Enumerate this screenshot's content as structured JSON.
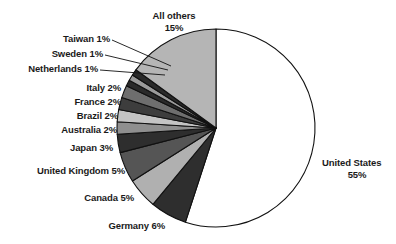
{
  "chart_data": {
    "type": "pie",
    "title": "",
    "subtitle": "",
    "xlabel": "",
    "ylabel": "",
    "legend": "none",
    "grid": false,
    "units": "percent",
    "start_angle_deg": 0,
    "direction": "clockwise",
    "categories": [
      "United States",
      "Germany",
      "Canada",
      "United Kingdom",
      "Japan",
      "Australia",
      "Brazil",
      "France",
      "Italy",
      "Netherlands",
      "Sweden",
      "Taiwan",
      "All others"
    ],
    "values": [
      55,
      6,
      5,
      5,
      3,
      2,
      2,
      2,
      2,
      1,
      1,
      1,
      15
    ],
    "slices": [
      {
        "name": "United States",
        "value": 55,
        "label": "United States",
        "value_label": "55%",
        "color": "#ffffff"
      },
      {
        "name": "Germany",
        "value": 6,
        "label": "Germany",
        "value_label": "6%",
        "color": "#2e2e2e"
      },
      {
        "name": "Canada",
        "value": 5,
        "label": "Canada",
        "value_label": "5%",
        "color": "#b0b0b0"
      },
      {
        "name": "United Kingdom",
        "value": 5,
        "label": "United Kingdom",
        "value_label": "5%",
        "color": "#555555"
      },
      {
        "name": "Japan",
        "value": 3,
        "label": "Japan",
        "value_label": "3%",
        "color": "#2e2e2e"
      },
      {
        "name": "Australia",
        "value": 2,
        "label": "Australia",
        "value_label": "2%",
        "color": "#8f8f8f"
      },
      {
        "name": "Brazil",
        "value": 2,
        "label": "Brazil",
        "value_label": "2%",
        "color": "#c4c4c4"
      },
      {
        "name": "France",
        "value": 2,
        "label": "France",
        "value_label": "2%",
        "color": "#3d3d3d"
      },
      {
        "name": "Italy",
        "value": 2,
        "label": "Italy",
        "value_label": "2%",
        "color": "#6e6e6e"
      },
      {
        "name": "Netherlands",
        "value": 1,
        "label": "Netherlands",
        "value_label": "1%",
        "color": "#2a2a2a"
      },
      {
        "name": "Sweden",
        "value": 1,
        "label": "Sweden",
        "value_label": "1%",
        "color": "#9a9a9a"
      },
      {
        "name": "Taiwan",
        "value": 1,
        "label": "Taiwan",
        "value_label": "1%",
        "color": "#2a2a2a"
      },
      {
        "name": "All others",
        "value": 15,
        "label": "All others",
        "value_label": "15%",
        "color": "#b5b5b5"
      }
    ]
  },
  "labels": {
    "all_others_name": "All others",
    "all_others_value": "15%",
    "taiwan": "Taiwan 1%",
    "sweden": "Sweden 1%",
    "netherlands": "Netherlands 1%",
    "italy": "Italy 2%",
    "france": "France 2%",
    "brazil": "Brazil 2%",
    "australia": "Australia 2%",
    "japan": "Japan 3%",
    "united_kingdom": "United Kingdom 5%",
    "canada": "Canada 5%",
    "germany": "Germany 6%",
    "united_states_name": "United States",
    "united_states_value": "55%"
  },
  "style": {
    "outline_color": "#111111",
    "background": "#ffffff",
    "text_color": "#1a1a1a"
  }
}
